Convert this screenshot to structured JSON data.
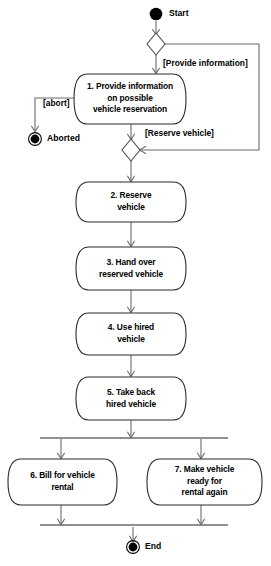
{
  "diagram": {
    "type": "uml-activity-diagram",
    "colors": {
      "background": "#ffffff",
      "node_stroke": "#2b2b2b",
      "edge_stroke": "#6b6b6b",
      "text": "#000000",
      "terminal_fill": "#000000"
    },
    "terminals": {
      "start": {
        "label": "Start",
        "kind": "initial-node"
      },
      "aborted": {
        "label": "Aborted",
        "kind": "final-node"
      },
      "end": {
        "label": "End",
        "kind": "final-node"
      }
    },
    "activities": [
      {
        "id": "activity-1",
        "number": "1.",
        "label": "1. Provide information\non possible\nvehicle reservation"
      },
      {
        "id": "activity-2",
        "number": "2.",
        "label": "2. Reserve\nvehicle"
      },
      {
        "id": "activity-3",
        "number": "3.",
        "label": "3. Hand over\nreserved vehicle"
      },
      {
        "id": "activity-4",
        "number": "4.",
        "label": "4. Use hired\nvehicle"
      },
      {
        "id": "activity-5",
        "number": "5.",
        "label": "5. Take back\nhired vehicle"
      },
      {
        "id": "activity-6",
        "number": "6.",
        "label": "6. Bill for vehicle\nrental"
      },
      {
        "id": "activity-7",
        "number": "7.",
        "label": "7. Make vehicle\nready for\nrental again"
      }
    ],
    "guards": [
      {
        "id": "guard-provide-information",
        "label": "[Provide information]"
      },
      {
        "id": "guard-abort",
        "label": "[abort]"
      },
      {
        "id": "guard-reserve-vehicle",
        "label": "[Reserve vehicle]"
      }
    ],
    "decisions": [
      {
        "id": "decision-1"
      },
      {
        "id": "decision-2"
      }
    ],
    "bars": [
      {
        "id": "fork-bar"
      },
      {
        "id": "join-bar"
      }
    ]
  }
}
